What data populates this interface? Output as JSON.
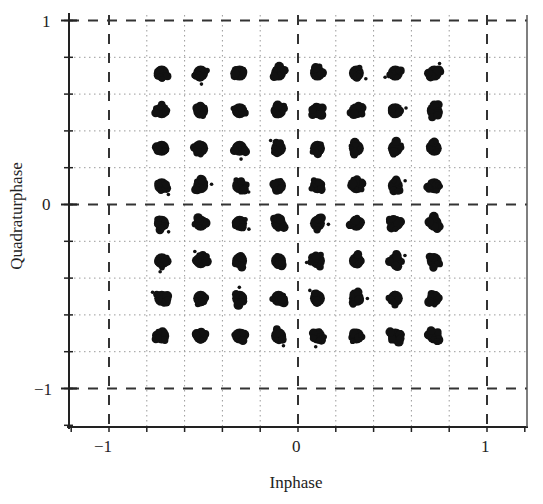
{
  "chart_data": {
    "type": "scatter",
    "title": "",
    "subtitle": "",
    "xlabel": "Inphase",
    "ylabel": "Quadraturphase",
    "xlim": [
      -1.2,
      1.2
    ],
    "ylim": [
      -1.2,
      1.0
    ],
    "x_ticks": [
      -1,
      0,
      1
    ],
    "y_ticks": [
      1,
      0,
      -1
    ],
    "x_tick_labels": [
      "−1",
      "0",
      "1"
    ],
    "y_tick_labels": [
      "1",
      "0",
      "−1"
    ],
    "grid": true,
    "grid_style": "dotted minor grid every 0.2, dashed reference lines at -1, 0, 1",
    "legend": null,
    "series": [
      {
        "name": "received symbols",
        "marker": "noisy cluster",
        "color": "#111111",
        "i_levels": [
          -0.7,
          -0.5,
          -0.3,
          -0.1,
          0.1,
          0.3,
          0.5,
          0.7
        ],
        "q_levels": [
          0.7,
          0.5,
          0.3,
          0.1,
          -0.1,
          -0.3,
          -0.5,
          -0.7
        ],
        "points_count": 64
      }
    ]
  },
  "colors": {
    "background": "#ffffff",
    "axis": "#222222",
    "dashed_lines": "#333333",
    "grid": "#9a9a9a",
    "points": "#111111"
  }
}
